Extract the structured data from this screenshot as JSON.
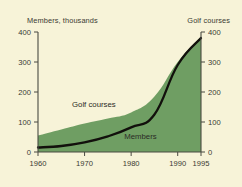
{
  "chart_data": {
    "type": "area",
    "title": "",
    "xlabel": "",
    "ylabel": "Members, thousands",
    "y2label": "Golf courses",
    "x": [
      1960,
      1965,
      1970,
      1975,
      1980,
      1985,
      1990,
      1995
    ],
    "xlim": [
      1960,
      1995
    ],
    "ylim": [
      0,
      400
    ],
    "y2lim": [
      0,
      400
    ],
    "xticks": [
      1960,
      1970,
      1980,
      1990,
      1995
    ],
    "xticklabels": [
      "1960",
      "1970",
      "1980",
      "1990",
      "1995"
    ],
    "yticks": [
      0,
      100,
      200,
      300,
      400
    ],
    "yticklabels": [
      "0",
      "100",
      "200",
      "300",
      "400"
    ],
    "y2ticks": [
      0,
      100,
      200,
      300,
      400
    ],
    "y2ticklabels": [
      "0",
      "100",
      "200",
      "300",
      "400"
    ],
    "grid": false,
    "legend_position": "inline-annotations",
    "background_color": "#f7f3d8",
    "area_color": "#6f9e63",
    "line_color": "#12100c",
    "series": [
      {
        "name": "Golf courses",
        "type": "area",
        "axis": "right",
        "color": "#6f9e63",
        "values": [
          55,
          75,
          95,
          112,
          132,
          185,
          300,
          385
        ]
      },
      {
        "name": "Members",
        "type": "line",
        "axis": "left",
        "color": "#12100c",
        "values": [
          15,
          20,
          32,
          52,
          82,
          125,
          290,
          380
        ]
      }
    ],
    "annotations": [
      {
        "text": "Golf courses",
        "x": 1972,
        "y": 150
      },
      {
        "text": "Members",
        "x": 1982,
        "y": 45
      }
    ]
  }
}
